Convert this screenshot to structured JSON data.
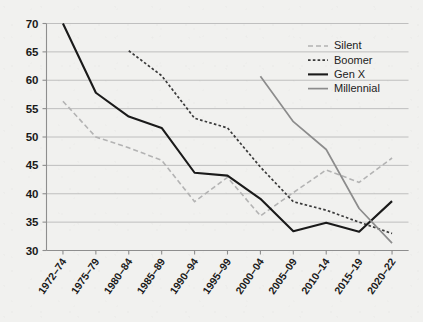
{
  "chart_data": {
    "type": "line",
    "title": "",
    "subtitle": "",
    "xlabel": "",
    "ylabel": "",
    "categories": [
      "1972–74",
      "1975–79",
      "1980–84",
      "1985–89",
      "1990–94",
      "1995–99",
      "2000–04",
      "2005–09",
      "2010–14",
      "2015–19",
      "2020–22"
    ],
    "ylim": [
      30,
      70
    ],
    "yticks": [
      30,
      35,
      40,
      45,
      50,
      55,
      60,
      65,
      70
    ],
    "ytick_labels": [
      "30",
      "35",
      "40",
      "45",
      "50",
      "55",
      "60",
      "65",
      "70"
    ],
    "grid": true,
    "legend_position": "top-right",
    "series": [
      {
        "name": "Silent",
        "color": "#b3b3b3",
        "style": "dashed",
        "width": 1.6,
        "values": [
          56.3,
          50.0,
          48.1,
          45.9,
          38.6,
          42.9,
          36.1,
          40.2,
          44.2,
          42.0,
          46.3
        ]
      },
      {
        "name": "Boomer",
        "color": "#3a3a3a",
        "style": "dotted",
        "width": 1.7,
        "values": [
          null,
          null,
          65.2,
          60.8,
          53.3,
          51.6,
          44.7,
          38.6,
          37.1,
          35.0,
          33.0
        ]
      },
      {
        "name": "Gen X",
        "color": "#1a1a1a",
        "style": "solid",
        "width": 2.1,
        "values": [
          70.0,
          57.8,
          53.6,
          51.6,
          43.7,
          43.2,
          39.1,
          33.4,
          34.9,
          33.3,
          38.7
        ]
      },
      {
        "name": "Millennial",
        "color": "#8c8c8c",
        "style": "solid",
        "width": 1.7,
        "values": [
          null,
          null,
          null,
          null,
          null,
          null,
          60.7,
          52.7,
          47.8,
          37.4,
          31.3
        ]
      }
    ]
  },
  "legend": {
    "entries": [
      {
        "label": "Silent"
      },
      {
        "label": "Boomer"
      },
      {
        "label": "Gen X"
      },
      {
        "label": "Millennial"
      }
    ]
  },
  "axes": {
    "y_tick_labels": [
      "70",
      "65",
      "60",
      "55",
      "50",
      "45",
      "40",
      "35",
      "30"
    ],
    "x_tick_labels": [
      "1972–74",
      "1975–79",
      "1980–84",
      "1985–89",
      "1990–94",
      "1995–99",
      "2000–04",
      "2005–09",
      "2010–14",
      "2015–19",
      "2020–22"
    ]
  },
  "colors": {
    "background": "#f1f1ef",
    "grid": "#b9b9b9",
    "axis": "#8e8e8e",
    "silent": "#b3b3b3",
    "boomer": "#3a3a3a",
    "genx": "#1a1a1a",
    "millennial": "#8c8c8c",
    "text": "#1a1a1a"
  }
}
